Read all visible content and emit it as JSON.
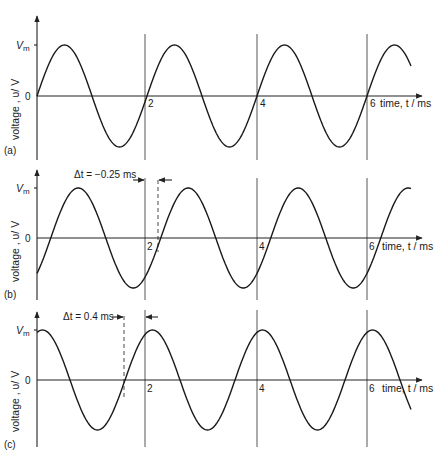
{
  "chart_data": [
    {
      "type": "line",
      "panel_label": "(a)",
      "xlabel": "time, t / ms",
      "ylabel": "voltage , υ/ V",
      "y_max_label": "Vm",
      "y_zero_label": "0",
      "x_ticks": [
        2,
        4,
        6
      ],
      "xlim": [
        0,
        6.9
      ],
      "ylim": [
        -1,
        1
      ],
      "grid": "vertical lines at t = 2, 4, 6 ms",
      "series": [
        {
          "name": "v(t) = Vm sin(2π·t/2)",
          "period_ms": 2,
          "phase_shift_ms": 0,
          "t_start": 0,
          "t_end": 6.8
        }
      ],
      "annotation": null
    },
    {
      "type": "line",
      "panel_label": "(b)",
      "xlabel": "time, t / ms",
      "ylabel": "voltage , υ/ V",
      "y_max_label": "Vm",
      "y_zero_label": "0",
      "x_ticks": [
        2,
        4,
        6
      ],
      "xlim": [
        0,
        6.9
      ],
      "ylim": [
        -1,
        1
      ],
      "grid": "vertical lines at t = 2, 4, 6 ms",
      "series": [
        {
          "name": "v(t) = Vm sin(2π·(t-0.25)/2)",
          "period_ms": 2,
          "phase_shift_ms": 0.25,
          "t_start": 0,
          "t_end": 6.8
        }
      ],
      "annotation": {
        "text": "Δt = −0.25 ms",
        "from_t": 2,
        "to_t": 2.25
      }
    },
    {
      "type": "line",
      "panel_label": "(c)",
      "xlabel": "time, t / ms",
      "ylabel": "voltage , υ/ V",
      "y_max_label": "Vm",
      "y_zero_label": "0",
      "x_ticks": [
        2,
        4,
        6
      ],
      "xlim": [
        0,
        6.9
      ],
      "ylim": [
        -1,
        1
      ],
      "grid": "vertical lines at t = 2, 4, 6 ms",
      "series": [
        {
          "name": "v(t) = Vm sin(2π·(t+0.4)/2)",
          "period_ms": 2,
          "phase_shift_ms": -0.4,
          "t_start": 0,
          "t_end": 6.8
        }
      ],
      "annotation": {
        "text": "Δt = 0.4 ms",
        "from_t": 1.6,
        "to_t": 2
      }
    }
  ],
  "panels": [
    {
      "label": "(a)",
      "vm": "V",
      "vm_sub": "m",
      "zero": "0",
      "ylabel": "voltage , υ/ V",
      "xlabel": "time, t / ms",
      "ticks": [
        "2",
        "4",
        "6"
      ],
      "delta": ""
    },
    {
      "label": "(b)",
      "vm": "V",
      "vm_sub": "m",
      "zero": "0",
      "ylabel": "voltage , υ/ V",
      "xlabel": "time, t / ms",
      "ticks": [
        "2",
        "4",
        "6"
      ],
      "delta": "Δt =  −0.25 ms"
    },
    {
      "label": "(c)",
      "vm": "V",
      "vm_sub": "m",
      "zero": "0",
      "ylabel": "voltage , υ/ V",
      "xlabel": "time, t / ms",
      "ticks": [
        "2",
        "4",
        "6"
      ],
      "delta": "Δt = 0.4 ms"
    }
  ]
}
